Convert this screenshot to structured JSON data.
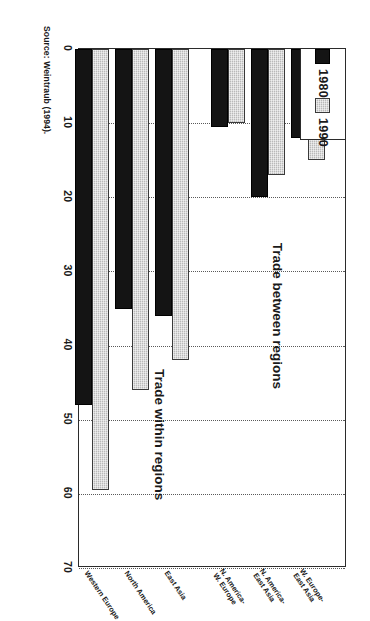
{
  "figure": {
    "source_note": "Source: Weintraub (1994).",
    "group_labels": {
      "within": "Trade within regions",
      "between": "Trade between regions"
    }
  },
  "legend": {
    "position": "top-left",
    "entries": [
      {
        "label": "1980",
        "color": "#141414"
      },
      {
        "label": "1990",
        "color": "#b9b9b9"
      }
    ]
  },
  "chart_data": {
    "type": "bar",
    "orientation": "horizontal",
    "title": "",
    "subtitle": "",
    "xlabel": "",
    "ylabel": "",
    "xlim": [
      0,
      70
    ],
    "ylim": [
      0,
      7
    ],
    "grid": true,
    "ticks": [
      "0",
      "10",
      "20",
      "30",
      "40",
      "50",
      "60",
      "70"
    ],
    "tick_values": [
      0,
      10,
      20,
      30,
      40,
      50,
      60,
      70
    ],
    "legend_position": "top-left",
    "categories": [
      "Western Europe",
      "North America",
      "East Asia",
      "N. America–\nW. Europe",
      "N. America–\nEast Asia",
      "W. Europe–\nEast Asia"
    ],
    "category_lines": [
      [
        "Western Europe"
      ],
      [
        "North America"
      ],
      [
        "East Asia"
      ],
      [
        "N. America-",
        "W. Europe"
      ],
      [
        "N. America-",
        "East Asia"
      ],
      [
        "W. Europe-",
        "East Asia"
      ]
    ],
    "groups": [
      {
        "label": "Trade within regions",
        "categories": [
          "Western Europe",
          "North America",
          "East Asia"
        ]
      },
      {
        "label": "Trade between regions",
        "categories": [
          "N. America–W. Europe",
          "N. America–East Asia",
          "W. Europe–East Asia"
        ]
      }
    ],
    "series": [
      {
        "name": "1980",
        "color": "#141414",
        "values": [
          48,
          35,
          36,
          10.5,
          20,
          12
        ]
      },
      {
        "name": "1990",
        "color": "#b9b9b9",
        "values": [
          59.5,
          46,
          42,
          10,
          17,
          15
        ]
      }
    ]
  }
}
